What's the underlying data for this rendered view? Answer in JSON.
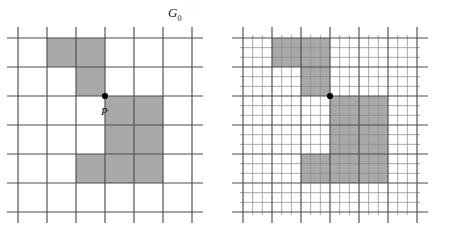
{
  "figure": {
    "background_color": "#ffffff",
    "shade_color": "#a9a9a9",
    "line_color": "#4d4d4d",
    "thin_line_color": "#8c8c8c",
    "dot_color": "#000000",
    "panels": [
      {
        "id": "coarse",
        "label": "G",
        "label_subscript": "0",
        "grid_type": "coarse",
        "cols": 6,
        "rows": 6,
        "cell_px": 29,
        "origin_x": 18,
        "origin_y": 38,
        "subdivision": 1,
        "shaded_cells": [
          [
            1,
            0
          ],
          [
            2,
            0
          ],
          [
            2,
            1
          ],
          [
            3,
            2
          ],
          [
            4,
            2
          ],
          [
            3,
            3
          ],
          [
            4,
            3
          ],
          [
            2,
            4
          ],
          [
            3,
            4
          ],
          [
            4,
            4
          ]
        ],
        "marked_point": {
          "label": "P",
          "col": 3,
          "row": 2,
          "corner": "top-left"
        }
      },
      {
        "id": "fine",
        "label": "G",
        "label_subscript": "",
        "grid_type": "fine",
        "cols": 18,
        "rows": 18,
        "cell_px": 9.6667,
        "origin_x": 18,
        "origin_y": 38,
        "subdivision": 3,
        "shaded_cells": [
          [
            1,
            0
          ],
          [
            2,
            0
          ],
          [
            2,
            1
          ],
          [
            3,
            2
          ],
          [
            4,
            2
          ],
          [
            3,
            3
          ],
          [
            4,
            3
          ],
          [
            2,
            4
          ],
          [
            3,
            4
          ],
          [
            4,
            4
          ]
        ],
        "marked_point": {
          "label": "",
          "col": 3,
          "row": 2,
          "corner": "top-left"
        }
      }
    ]
  },
  "labels": {
    "left_panel": "G",
    "left_panel_subscript": "0",
    "right_panel": "G",
    "point": "P"
  }
}
